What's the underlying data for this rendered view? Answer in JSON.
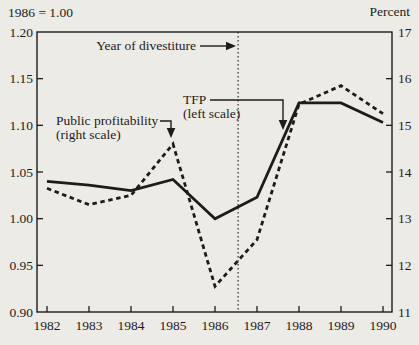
{
  "chart_data": {
    "type": "line",
    "x": [
      1982,
      1983,
      1984,
      1985,
      1986,
      1987,
      1988,
      1989,
      1990
    ],
    "x_tick_labels": [
      "1982",
      "1983",
      "1984",
      "1985",
      "1986",
      "1987",
      "1988",
      "1989",
      "1990"
    ],
    "left_axis": {
      "title": "1986 = 1.00",
      "min": 0.9,
      "max": 1.2,
      "ticks": [
        1.2,
        1.15,
        1.1,
        1.05,
        1.0,
        0.95,
        0.9
      ],
      "tick_labels": [
        "1.20",
        "1.15",
        "1.10",
        "1.05",
        "1.00",
        "0.95",
        "0.90"
      ]
    },
    "right_axis": {
      "title": "Percent",
      "min": 11,
      "max": 17,
      "ticks": [
        17,
        16,
        15,
        14,
        13,
        12,
        11
      ],
      "tick_labels": [
        "17",
        "16",
        "15",
        "14",
        "13",
        "12",
        "11"
      ]
    },
    "series": [
      {
        "name": "TFP",
        "scale_note": "(left scale)",
        "axis": "left",
        "line_style": "solid",
        "values": [
          1.04,
          1.036,
          1.03,
          1.042,
          1.0,
          1.023,
          1.124,
          1.124,
          1.103
        ]
      },
      {
        "name": "Public profitability",
        "scale_note": "(right scale)",
        "axis": "right",
        "line_style": "dashed",
        "values": [
          13.65,
          13.3,
          13.5,
          14.6,
          11.55,
          12.55,
          15.45,
          15.85,
          15.25
        ]
      }
    ],
    "annotations": [
      {
        "id": "divestiture",
        "label": "Year of divestiture",
        "x": 1986.55
      }
    ],
    "grid": false,
    "legend_position": "inline-annotations",
    "ink_color": "#1c1c1c",
    "paper_color": "#edebe5"
  }
}
